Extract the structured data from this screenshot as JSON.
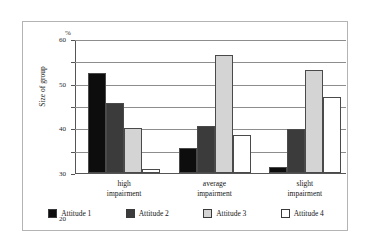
{
  "chart_data": {
    "type": "bar",
    "title": "",
    "subtitle": "",
    "xlabel": "",
    "ylabel": "Size of group",
    "unit_label": "%",
    "ylim": [
      0,
      60
    ],
    "yticks": [
      0,
      10,
      20,
      30,
      40,
      50,
      60
    ],
    "ytick_labels": [
      "0",
      "10",
      "20",
      "30",
      "40",
      "50",
      "60"
    ],
    "grid": true,
    "legend_position": "bottom",
    "categories": [
      "high impairment",
      "average impairment",
      "slight impairment"
    ],
    "category_lines": [
      [
        "high",
        "impairment"
      ],
      [
        "average",
        "impairment"
      ],
      [
        "slight",
        "impairment"
      ]
    ],
    "series": [
      {
        "name": "Attitude 1",
        "color": "#0d0d0d",
        "values": [
          45,
          11,
          2.5
        ]
      },
      {
        "name": "Attitude 2",
        "color": "#3b3b3b",
        "values": [
          31.5,
          21,
          19.5
        ]
      },
      {
        "name": "Attitude 3",
        "color": "#d4d4d4",
        "values": [
          20,
          53,
          46
        ]
      },
      {
        "name": "Attitude 4",
        "color": "#ffffff",
        "values": [
          2,
          17,
          34
        ]
      }
    ]
  },
  "legend": {
    "items": [
      {
        "label": "Attitude 1",
        "color": "#0d0d0d"
      },
      {
        "label": "Attitude 2",
        "color": "#3b3b3b"
      },
      {
        "label": "Attitude 3",
        "color": "#d4d4d4"
      },
      {
        "label": "Attitude 4",
        "color": "#ffffff"
      }
    ]
  }
}
